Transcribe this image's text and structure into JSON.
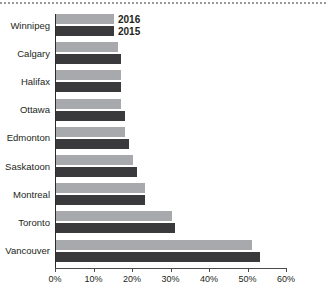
{
  "chart_data": {
    "type": "bar",
    "orientation": "horizontal",
    "title": "",
    "subtitle": "",
    "xlabel": "",
    "ylabel": "",
    "xlim": [
      0,
      60
    ],
    "xtick_labels": [
      "0%",
      "10%",
      "20%",
      "30%",
      "40%",
      "50%",
      "60%"
    ],
    "xtick_values": [
      0,
      10,
      20,
      30,
      40,
      50,
      60
    ],
    "xtick_suffix": "%",
    "grid": false,
    "legend_position": "top-left-inside",
    "categories": [
      "Winnipeg",
      "Calgary",
      "Halifax",
      "Ottawa",
      "Edmonton",
      "Saskatoon",
      "Montreal",
      "Toronto",
      "Vancouver"
    ],
    "series": [
      {
        "name": "2016",
        "color": "#a7a9ac",
        "values": [
          15,
          16,
          17,
          17,
          18,
          20,
          23,
          30,
          51
        ]
      },
      {
        "name": "2015",
        "color": "#3a3a3c",
        "values": [
          15,
          17,
          17,
          18,
          19,
          21,
          23,
          31,
          53
        ]
      }
    ]
  },
  "legend": {
    "entries": [
      {
        "label": "2016"
      },
      {
        "label": "2015"
      }
    ]
  },
  "colors": {
    "series_2016": "#a7a9ac",
    "series_2015": "#3a3a3c",
    "axis": "#2b2b2b",
    "text": "#231f20",
    "background": "#ffffff"
  }
}
